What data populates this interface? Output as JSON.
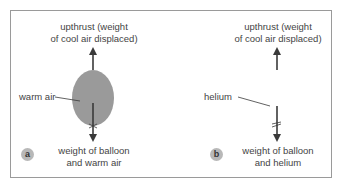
{
  "panels": [
    {
      "id": "a",
      "badge": "a",
      "upthrust_label_line1": "upthrust (weight",
      "upthrust_label_line2": "of cool air displaced)",
      "contents_label": "warm air",
      "weight_label_line1": "weight of balloon",
      "weight_label_line2": "and warm air",
      "balloon_color": "#9a9a9a"
    },
    {
      "id": "b",
      "badge": "b",
      "upthrust_label_line1": "upthrust (weight",
      "upthrust_label_line2": "of cool air displaced)",
      "contents_label": "helium",
      "weight_label_line1": "weight of balloon",
      "weight_label_line2": "and helium",
      "balloon_color": "#ffffff"
    }
  ],
  "colors": {
    "arrow": "#3a3a3a",
    "frame": "#9a9a9a",
    "badge": "#b8b8b8"
  }
}
